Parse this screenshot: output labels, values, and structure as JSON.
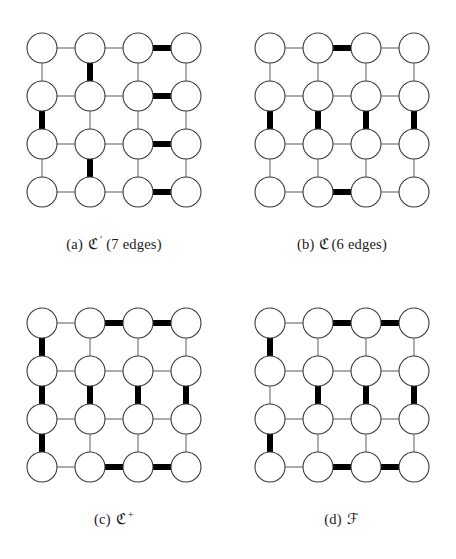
{
  "figure": {
    "background_color": "#ffffff",
    "node_fill": "#ffffff",
    "node_stroke": "#3a3a3a",
    "thin_edge_color": "#6b6b6b",
    "bold_edge_color": "#000000",
    "thin_edge_width": 1.1,
    "bold_edge_width": 6,
    "node_radius": 15,
    "grid_rows": 4,
    "grid_cols": 4,
    "cell_spacing": 48
  },
  "panels": [
    {
      "id": "a",
      "caption_tag": "(a)",
      "caption_symbol": "ℭ",
      "caption_superscript": "′",
      "caption_rest": "(7 edges)",
      "caption_full": "(a) ℭ′ (7 edges)",
      "bold_edge_count": 7,
      "bold_edges": [
        {
          "type": "h",
          "row": 1,
          "col": 3
        },
        {
          "type": "h",
          "row": 2,
          "col": 3
        },
        {
          "type": "h",
          "row": 3,
          "col": 3
        },
        {
          "type": "h",
          "row": 4,
          "col": 3
        },
        {
          "type": "v",
          "row": 1,
          "col": 2
        },
        {
          "type": "v",
          "row": 2,
          "col": 1
        },
        {
          "type": "v",
          "row": 3,
          "col": 2
        }
      ]
    },
    {
      "id": "b",
      "caption_tag": "(b)",
      "caption_symbol": "ℭ",
      "caption_superscript": "",
      "caption_rest": "(6 edges)",
      "caption_full": "(b) ℭ(6 edges)",
      "bold_edge_count": 6,
      "bold_edges": [
        {
          "type": "h",
          "row": 1,
          "col": 2
        },
        {
          "type": "v",
          "row": 2,
          "col": 1
        },
        {
          "type": "v",
          "row": 2,
          "col": 2
        },
        {
          "type": "v",
          "row": 2,
          "col": 3
        },
        {
          "type": "v",
          "row": 2,
          "col": 4
        },
        {
          "type": "h",
          "row": 4,
          "col": 2
        }
      ]
    },
    {
      "id": "c",
      "caption_tag": "(c)",
      "caption_symbol": "ℭ",
      "caption_superscript": "+",
      "caption_rest": "",
      "caption_full": "(c) ℭ⁺",
      "bold_edge_count": 11,
      "bold_edges": [
        {
          "type": "h",
          "row": 1,
          "col": 2
        },
        {
          "type": "h",
          "row": 1,
          "col": 3
        },
        {
          "type": "v",
          "row": 1,
          "col": 1
        },
        {
          "type": "v",
          "row": 2,
          "col": 1
        },
        {
          "type": "v",
          "row": 3,
          "col": 1
        },
        {
          "type": "v",
          "row": 2,
          "col": 2
        },
        {
          "type": "v",
          "row": 2,
          "col": 3
        },
        {
          "type": "v",
          "row": 2,
          "col": 4
        },
        {
          "type": "h",
          "row": 4,
          "col": 2
        },
        {
          "type": "h",
          "row": 4,
          "col": 3
        }
      ]
    },
    {
      "id": "d",
      "caption_tag": "(d)",
      "caption_symbol": "ℱ",
      "caption_superscript": "",
      "caption_rest": "",
      "caption_full": "(d) ℱ",
      "bold_edge_count": 10,
      "bold_edges": [
        {
          "type": "h",
          "row": 1,
          "col": 2
        },
        {
          "type": "h",
          "row": 1,
          "col": 3
        },
        {
          "type": "v",
          "row": 1,
          "col": 1
        },
        {
          "type": "v",
          "row": 3,
          "col": 1
        },
        {
          "type": "v",
          "row": 2,
          "col": 2
        },
        {
          "type": "v",
          "row": 2,
          "col": 3
        },
        {
          "type": "v",
          "row": 2,
          "col": 4
        },
        {
          "type": "h",
          "row": 4,
          "col": 2
        },
        {
          "type": "h",
          "row": 4,
          "col": 3
        }
      ]
    }
  ]
}
